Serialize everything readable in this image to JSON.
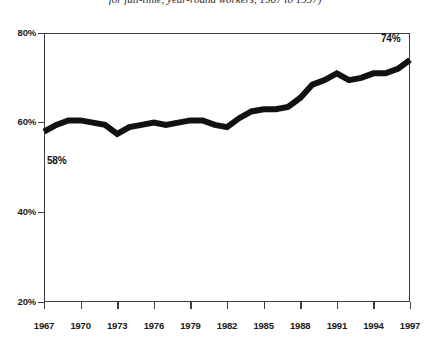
{
  "caption": {
    "text": "for full-time, year-round workers, 1967 to 1997)"
  },
  "colors": {
    "line": "#111111",
    "frame": "#3c3c3c",
    "gridline": "#9a9a9a",
    "background": "#ffffff",
    "text": "#111111"
  },
  "axes": {
    "y_ticks": [
      "80%",
      "60%",
      "40%",
      "20%"
    ],
    "x_ticks": [
      "1967",
      "1970",
      "1973",
      "1976",
      "1979",
      "1982",
      "1985",
      "1988",
      "1991",
      "1994",
      "1997"
    ]
  },
  "annotations": {
    "start_label": "58%",
    "end_label": "74%"
  },
  "chart_data": {
    "type": "line",
    "title": "",
    "subtitle": "for full-time, year-round workers, 1967 to 1997)",
    "xlabel": "",
    "ylabel": "",
    "xlim": [
      1967,
      1997
    ],
    "ylim": [
      20,
      80
    ],
    "grid": true,
    "legend": "none",
    "y_tick_values": [
      80,
      60,
      40,
      20
    ],
    "y_tick_labels": [
      "80%",
      "60%",
      "40%",
      "20%"
    ],
    "x_tick_values": [
      1967,
      1970,
      1973,
      1976,
      1979,
      1982,
      1985,
      1988,
      1991,
      1994,
      1997
    ],
    "x_tick_labels": [
      "1967",
      "1970",
      "1973",
      "1976",
      "1979",
      "1982",
      "1985",
      "1988",
      "1991",
      "1994",
      "1997"
    ],
    "annotations": [
      {
        "text": "58%",
        "x": 1967,
        "y": 58
      },
      {
        "text": "74%",
        "x": 1997,
        "y": 74
      }
    ],
    "series": [
      {
        "name": "Women's earnings as a percentage of men's",
        "x": [
          1967,
          1968,
          1969,
          1970,
          1971,
          1972,
          1973,
          1974,
          1975,
          1976,
          1977,
          1978,
          1979,
          1980,
          1981,
          1982,
          1983,
          1984,
          1985,
          1986,
          1987,
          1988,
          1989,
          1990,
          1991,
          1992,
          1993,
          1994,
          1995,
          1996,
          1997
        ],
        "y": [
          58,
          59.5,
          60.5,
          60.5,
          60,
          59.5,
          57.5,
          59,
          59.5,
          60,
          59.5,
          60,
          60.5,
          60.5,
          59.5,
          59,
          61,
          62.5,
          63,
          63,
          63.5,
          65.5,
          68.5,
          69.5,
          71,
          69.5,
          70,
          71,
          71,
          72,
          74
        ]
      }
    ]
  }
}
